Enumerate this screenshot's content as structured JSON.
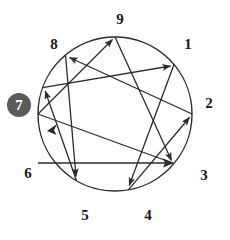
{
  "figure": {
    "type": "enneagram-diagram",
    "highlighted_point": "7",
    "stroke_color": "#2b2b2b",
    "badge_color": "#5b5b5b",
    "badge_text_color": "#ffffff",
    "background_color": "#ffffff"
  },
  "circle": {
    "cx": 115,
    "cy": 114,
    "r": 77,
    "stroke_width": 1.4
  },
  "points": [
    {
      "number": "1",
      "angle_deg": 40,
      "node_x": 174.0,
      "node_y": 64.5,
      "label_x": 188,
      "label_y": 45,
      "highlighted": false
    },
    {
      "number": "2",
      "angle_deg": 0,
      "node_x": 192.0,
      "node_y": 114.0,
      "label_x": 207,
      "label_y": 104,
      "highlighted": false
    },
    {
      "number": "3",
      "angle_deg": -40,
      "node_x": 174.0,
      "node_y": 163.5,
      "label_x": 202,
      "label_y": 176,
      "highlighted": false
    },
    {
      "number": "4",
      "angle_deg": -80,
      "node_x": 128.4,
      "node_y": 189.8,
      "label_x": 148,
      "label_y": 216,
      "highlighted": false
    },
    {
      "number": "5",
      "angle_deg": -120,
      "node_x": 76.5,
      "node_y": 180.7,
      "label_x": 85,
      "label_y": 216,
      "highlighted": false
    },
    {
      "number": "6",
      "angle_deg": 180,
      "node_x": 38.0,
      "node_y": 114.0,
      "label_x": 28,
      "label_y": 174,
      "highlighted": false
    },
    {
      "number": "7",
      "angle_deg": 160,
      "node_x": 42.6,
      "node_y": 87.7,
      "label_x": 19,
      "label_y": 105,
      "highlighted": true
    },
    {
      "number": "8",
      "angle_deg": 130,
      "node_x": 65.5,
      "node_y": 55.0,
      "label_x": 54,
      "label_y": 45,
      "highlighted": false
    },
    {
      "number": "9",
      "angle_deg": 90,
      "node_x": 115.0,
      "node_y": 37.0,
      "label_x": 120,
      "label_y": 20,
      "highlighted": false
    }
  ],
  "connections": {
    "triangle": {
      "name": "inner-triangle",
      "sequence": [
        "9",
        "6",
        "3",
        "9"
      ],
      "edges": [
        {
          "from": "9",
          "to": "3",
          "arrow": "to"
        },
        {
          "from": "3",
          "to": "6",
          "arrow": "none"
        },
        {
          "from": "6",
          "to": "9",
          "arrow": "to"
        }
      ]
    },
    "hexad": {
      "name": "hexad-path",
      "sequence": [
        "1",
        "4",
        "2",
        "8",
        "5",
        "7",
        "1"
      ],
      "edges": [
        {
          "from": "1",
          "to": "4",
          "arrow": "to"
        },
        {
          "from": "4",
          "to": "2",
          "arrow": "to"
        },
        {
          "from": "2",
          "to": "8",
          "arrow": "to"
        },
        {
          "from": "8",
          "to": "5",
          "arrow": "to"
        },
        {
          "from": "5",
          "to": "7",
          "arrow": "to"
        },
        {
          "from": "7",
          "to": "1",
          "arrow": "to"
        }
      ]
    },
    "horizontal": {
      "name": "six-to-three-line",
      "from": "6",
      "to": "3",
      "arrow": "to"
    }
  }
}
